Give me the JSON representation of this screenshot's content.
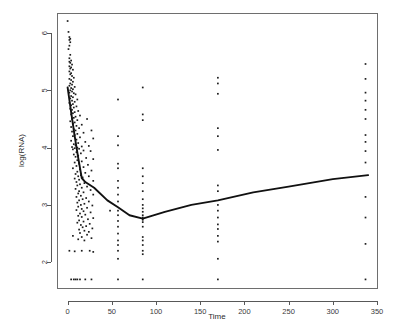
{
  "figure": {
    "kind": "scatter-plot-with-fitted-line",
    "background_color": "#ffffff",
    "point_color": "#1c1c1c",
    "line_color": "#111111",
    "axis_color": "#585858"
  },
  "chart_data": {
    "type": "scatter",
    "title": "",
    "subtitle": "",
    "xlabel": "Time",
    "ylabel": "log(RNA)",
    "xlim": [
      -12,
      350
    ],
    "ylim": [
      1.55,
      6.35
    ],
    "xticks": [
      0,
      50,
      100,
      150,
      200,
      250,
      300,
      350
    ],
    "xtick_labels": [
      "0",
      "50",
      "100",
      "150",
      "200",
      "250",
      "300",
      "350"
    ],
    "yticks": [
      2,
      3,
      4,
      5,
      6
    ],
    "ytick_labels": [
      "2",
      "3",
      "4",
      "5",
      "6"
    ],
    "grid": false,
    "legend": null,
    "legend_position": "none",
    "marker": "square",
    "marker_size_px": 1.7,
    "annotations": [
      "Dense cluster of observations at early Time (0-30)",
      "Discrete visit columns near Time = 57, 85, 170, 337",
      "Flat row of censored values at log(RNA) = 1.70 (assay detection limit)"
    ],
    "series": [
      {
        "name": "log(RNA) observations",
        "type": "scatter",
        "points": [
          [
            0,
            6.21
          ],
          [
            1,
            6.02
          ],
          [
            2,
            5.93
          ],
          [
            2,
            5.88
          ],
          [
            3,
            5.9
          ],
          [
            3,
            5.84
          ],
          [
            2,
            5.78
          ],
          [
            1,
            5.72
          ],
          [
            3,
            5.62
          ],
          [
            2,
            5.56
          ],
          [
            4,
            5.52
          ],
          [
            2,
            5.5
          ],
          [
            3,
            5.48
          ],
          [
            5,
            5.45
          ],
          [
            2,
            5.42
          ],
          [
            4,
            5.4
          ],
          [
            3,
            5.38
          ],
          [
            6,
            5.36
          ],
          [
            2,
            5.33
          ],
          [
            4,
            5.3
          ],
          [
            3,
            5.28
          ],
          [
            5,
            5.25
          ],
          [
            7,
            5.22
          ],
          [
            2,
            5.2
          ],
          [
            4,
            5.18
          ],
          [
            6,
            5.15
          ],
          [
            3,
            5.12
          ],
          [
            5,
            5.1
          ],
          [
            2,
            5.08
          ],
          [
            8,
            5.06
          ],
          [
            4,
            5.04
          ],
          [
            6,
            5.02
          ],
          [
            3,
            5.0
          ],
          [
            5,
            4.98
          ],
          [
            2,
            4.96
          ],
          [
            7,
            4.95
          ],
          [
            9,
            4.93
          ],
          [
            4,
            4.9
          ],
          [
            6,
            4.88
          ],
          [
            3,
            4.86
          ],
          [
            11,
            4.84
          ],
          [
            5,
            4.82
          ],
          [
            8,
            4.8
          ],
          [
            2,
            4.78
          ],
          [
            6,
            4.76
          ],
          [
            4,
            4.74
          ],
          [
            10,
            4.72
          ],
          [
            7,
            4.7
          ],
          [
            3,
            4.68
          ],
          [
            5,
            4.66
          ],
          [
            12,
            4.64
          ],
          [
            8,
            4.62
          ],
          [
            6,
            4.6
          ],
          [
            4,
            4.58
          ],
          [
            14,
            4.56
          ],
          [
            9,
            4.54
          ],
          [
            7,
            4.52
          ],
          [
            5,
            4.5
          ],
          [
            22,
            4.5
          ],
          [
            11,
            4.48
          ],
          [
            3,
            4.46
          ],
          [
            8,
            4.44
          ],
          [
            6,
            4.42
          ],
          [
            16,
            4.4
          ],
          [
            10,
            4.38
          ],
          [
            4,
            4.36
          ],
          [
            13,
            4.34
          ],
          [
            7,
            4.32
          ],
          [
            9,
            4.3
          ],
          [
            27,
            4.3
          ],
          [
            5,
            4.28
          ],
          [
            18,
            4.26
          ],
          [
            11,
            4.24
          ],
          [
            8,
            4.22
          ],
          [
            6,
            4.2
          ],
          [
            14,
            4.18
          ],
          [
            29,
            4.16
          ],
          [
            10,
            4.14
          ],
          [
            4,
            4.12
          ],
          [
            20,
            4.1
          ],
          [
            12,
            4.08
          ],
          [
            7,
            4.06
          ],
          [
            9,
            4.04
          ],
          [
            24,
            4.03
          ],
          [
            16,
            4.02
          ],
          [
            5,
            4.01
          ],
          [
            11,
            4.0
          ],
          [
            8,
            3.99
          ],
          [
            13,
            3.98
          ],
          [
            6,
            3.97
          ],
          [
            18,
            3.95
          ],
          [
            26,
            3.94
          ],
          [
            10,
            3.92
          ],
          [
            15,
            3.9
          ],
          [
            7,
            3.88
          ],
          [
            12,
            3.86
          ],
          [
            9,
            3.84
          ],
          [
            21,
            3.82
          ],
          [
            29,
            3.8
          ],
          [
            11,
            3.78
          ],
          [
            16,
            3.76
          ],
          [
            8,
            3.74
          ],
          [
            13,
            3.72
          ],
          [
            23,
            3.7
          ],
          [
            10,
            3.68
          ],
          [
            18,
            3.66
          ],
          [
            6,
            3.64
          ],
          [
            14,
            3.62
          ],
          [
            27,
            3.6
          ],
          [
            11,
            3.58
          ],
          [
            20,
            3.56
          ],
          [
            9,
            3.54
          ],
          [
            15,
            3.52
          ],
          [
            12,
            3.5
          ],
          [
            24,
            3.5
          ],
          [
            17,
            3.48
          ],
          [
            8,
            3.46
          ],
          [
            13,
            3.44
          ],
          [
            29,
            3.42
          ],
          [
            10,
            3.4
          ],
          [
            19,
            3.38
          ],
          [
            14,
            3.36
          ],
          [
            11,
            3.34
          ],
          [
            22,
            3.32
          ],
          [
            16,
            3.3
          ],
          [
            9,
            3.28
          ],
          [
            26,
            3.26
          ],
          [
            13,
            3.24
          ],
          [
            18,
            3.22
          ],
          [
            12,
            3.2
          ],
          [
            29,
            3.18
          ],
          [
            15,
            3.16
          ],
          [
            10,
            3.14
          ],
          [
            21,
            3.12
          ],
          [
            17,
            3.1
          ],
          [
            13,
            3.08
          ],
          [
            24,
            3.06
          ],
          [
            11,
            3.04
          ],
          [
            19,
            3.02
          ],
          [
            15,
            3.0
          ],
          [
            28,
            2.99
          ],
          [
            12,
            2.97
          ],
          [
            22,
            2.95
          ],
          [
            16,
            2.93
          ],
          [
            10,
            2.91
          ],
          [
            18,
            2.89
          ],
          [
            26,
            2.87
          ],
          [
            14,
            2.85
          ],
          [
            20,
            2.83
          ],
          [
            12,
            2.81
          ],
          [
            16,
            2.79
          ],
          [
            29,
            2.77
          ],
          [
            23,
            2.75
          ],
          [
            13,
            2.73
          ],
          [
            18,
            2.71
          ],
          [
            11,
            2.69
          ],
          [
            25,
            2.67
          ],
          [
            15,
            2.65
          ],
          [
            21,
            2.63
          ],
          [
            17,
            2.61
          ],
          [
            28,
            2.59
          ],
          [
            13,
            2.57
          ],
          [
            19,
            2.55
          ],
          [
            24,
            2.53
          ],
          [
            14,
            2.51
          ],
          [
            6,
            2.46
          ],
          [
            22,
            2.48
          ],
          [
            16,
            2.44
          ],
          [
            27,
            2.42
          ],
          [
            12,
            2.4
          ],
          [
            19,
            2.38
          ],
          [
            2,
            2.2
          ],
          [
            8,
            2.19
          ],
          [
            16,
            2.2
          ],
          [
            25,
            2.2
          ],
          [
            29,
            2.18
          ],
          [
            4,
            1.7
          ],
          [
            7,
            1.7
          ],
          [
            9,
            1.7
          ],
          [
            11,
            1.7
          ],
          [
            14,
            1.7
          ],
          [
            20,
            1.7
          ],
          [
            27,
            1.7
          ],
          [
            57,
            4.84
          ],
          [
            57,
            4.2
          ],
          [
            57,
            4.04
          ],
          [
            57,
            3.72
          ],
          [
            57,
            3.64
          ],
          [
            57,
            3.42
          ],
          [
            57,
            3.3
          ],
          [
            57,
            3.18
          ],
          [
            57,
            3.06
          ],
          [
            57,
            2.9
          ],
          [
            57,
            2.82
          ],
          [
            57,
            2.72
          ],
          [
            57,
            2.62
          ],
          [
            57,
            2.5
          ],
          [
            57,
            2.38
          ],
          [
            57,
            2.3
          ],
          [
            57,
            2.2
          ],
          [
            57,
            2.06
          ],
          [
            48,
            2.9
          ],
          [
            57,
            1.7
          ],
          [
            85,
            5.05
          ],
          [
            85,
            4.58
          ],
          [
            85,
            4.48
          ],
          [
            85,
            3.64
          ],
          [
            85,
            3.5
          ],
          [
            85,
            3.38
          ],
          [
            85,
            3.24
          ],
          [
            85,
            3.1
          ],
          [
            85,
            3.0
          ],
          [
            85,
            2.94
          ],
          [
            85,
            2.88
          ],
          [
            85,
            2.82
          ],
          [
            85,
            2.78
          ],
          [
            85,
            2.74
          ],
          [
            85,
            2.7
          ],
          [
            85,
            2.62
          ],
          [
            85,
            2.44
          ],
          [
            85,
            2.38
          ],
          [
            85,
            2.3
          ],
          [
            85,
            2.2
          ],
          [
            85,
            2.14
          ],
          [
            85,
            1.7
          ],
          [
            170,
            5.22
          ],
          [
            170,
            5.12
          ],
          [
            170,
            4.94
          ],
          [
            170,
            4.34
          ],
          [
            170,
            4.2
          ],
          [
            170,
            3.96
          ],
          [
            170,
            3.34
          ],
          [
            170,
            3.24
          ],
          [
            170,
            3.0
          ],
          [
            170,
            2.9
          ],
          [
            170,
            2.78
          ],
          [
            170,
            2.66
          ],
          [
            170,
            2.58
          ],
          [
            170,
            2.46
          ],
          [
            170,
            2.36
          ],
          [
            170,
            2.06
          ],
          [
            170,
            1.7
          ],
          [
            337,
            5.46
          ],
          [
            337,
            5.2
          ],
          [
            337,
            4.96
          ],
          [
            337,
            4.82
          ],
          [
            337,
            4.66
          ],
          [
            337,
            4.5
          ],
          [
            337,
            4.22
          ],
          [
            337,
            4.1
          ],
          [
            337,
            3.94
          ],
          [
            337,
            3.74
          ],
          [
            337,
            3.14
          ],
          [
            337,
            2.78
          ],
          [
            337,
            2.32
          ],
          [
            337,
            1.7
          ]
        ]
      },
      {
        "name": "fitted piecewise trend",
        "type": "line",
        "points": [
          [
            0,
            5.05
          ],
          [
            4,
            4.62
          ],
          [
            8,
            4.2
          ],
          [
            12,
            3.82
          ],
          [
            16,
            3.47
          ],
          [
            20,
            3.4
          ],
          [
            30,
            3.3
          ],
          [
            45,
            3.08
          ],
          [
            57,
            2.96
          ],
          [
            70,
            2.82
          ],
          [
            85,
            2.76
          ],
          [
            110,
            2.88
          ],
          [
            140,
            3.0
          ],
          [
            170,
            3.08
          ],
          [
            210,
            3.22
          ],
          [
            250,
            3.32
          ],
          [
            300,
            3.45
          ],
          [
            340,
            3.52
          ]
        ]
      }
    ]
  }
}
